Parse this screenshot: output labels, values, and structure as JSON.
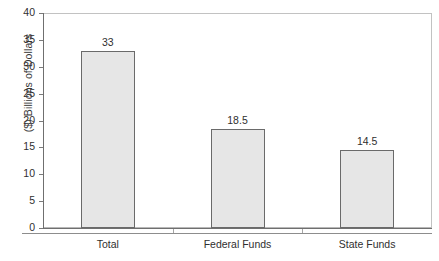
{
  "chart_data": {
    "type": "bar",
    "title": "",
    "subtitle": "",
    "xlabel": "",
    "ylabel": "($) Billions of Dollars",
    "categories": [
      "Total",
      "Federal Funds",
      "State Funds"
    ],
    "values": [
      33,
      18.5,
      14.5
    ],
    "value_labels": [
      "33",
      "18.5",
      "14.5"
    ],
    "ylim": [
      0,
      40
    ],
    "ytick_step": 5,
    "yticks": [
      0,
      5,
      10,
      15,
      20,
      25,
      30,
      35,
      40
    ],
    "ytick_labels": [
      "0",
      "5",
      "10",
      "15",
      "20",
      "25",
      "30",
      "35",
      "40"
    ],
    "grid": false,
    "legend": false,
    "legend_position": "none",
    "bar_fill_color": "#e6e6e6",
    "bar_border_color": "#6a6a6a",
    "axis_color": "#6f6f6f",
    "frame_color": "#b8b8b8",
    "text_color": "#2f2f2f"
  }
}
